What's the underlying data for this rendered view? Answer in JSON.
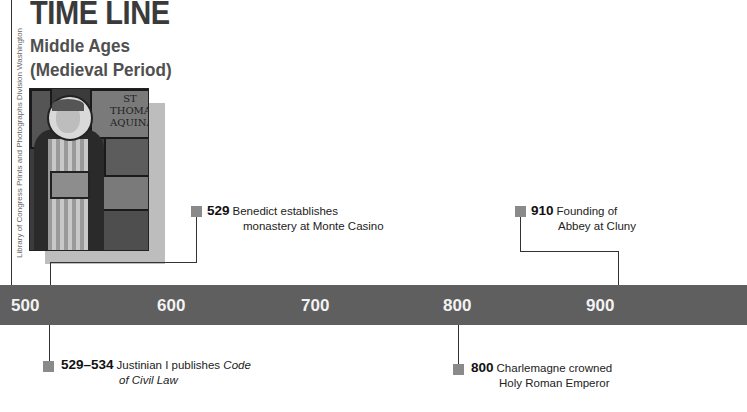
{
  "header": {
    "title": "TIME LINE",
    "subtitle_line1": "Middle Ages",
    "subtitle_line2": "(Medieval Period)"
  },
  "photo": {
    "subject": "stained-glass window of St. Thomas Aquinas",
    "inscription_line1": "ST",
    "inscription_line2": "THOMAS",
    "inscription_line3": "AQUINAS",
    "credit": "Library of Congress Prints and Photographs Division Washington"
  },
  "colors": {
    "bar": "#5f5f5f",
    "tick_text": "#f2f2f2",
    "marker": "#8a8a8a",
    "photo_shadow": "#bdbdbd",
    "title": "#3a3a3a"
  },
  "timeline": {
    "ticks": [
      "500",
      "600",
      "700",
      "800",
      "900"
    ],
    "events_above": [
      {
        "year": "529",
        "line1": "Benedict establishes",
        "line2": "monastery at Monte Casino"
      },
      {
        "year": "910",
        "line1": "Founding of",
        "line2": "Abbey at Cluny"
      }
    ],
    "events_below": [
      {
        "year": "529–534",
        "line1_plain": "Justinian I publishes ",
        "line1_italic": "Code",
        "line2_italic": "of Civil Law"
      },
      {
        "year": "800",
        "line1": "Charlemagne crowned",
        "line2": "Holy Roman Emperor"
      }
    ]
  }
}
